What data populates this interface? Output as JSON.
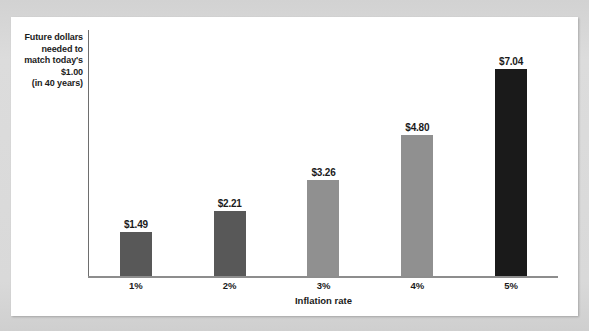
{
  "chart_data": {
    "type": "bar",
    "title": "",
    "xlabel": "Inflation rate",
    "ylabel": "Future dollars needed to match today's $1.00 (in 40 years)",
    "ylabel_lines": [
      "Future dollars",
      "needed to",
      "match today's",
      "$1.00",
      "(in 40 years)"
    ],
    "categories": [
      "1%",
      "2%",
      "3%",
      "4%",
      "5%"
    ],
    "values": [
      1.49,
      2.21,
      3.26,
      4.8,
      7.04
    ],
    "value_labels": [
      "$1.49",
      "$2.21",
      "$3.26",
      "$4.80",
      "$7.04"
    ],
    "bar_colors": [
      "#585858",
      "#585858",
      "#909090",
      "#909090",
      "#1a1a1a"
    ],
    "ylim": [
      0,
      8.35
    ],
    "grid": false,
    "legend": "none",
    "axis_color": "#8d8d8d",
    "value_label_color": "#1b1b1b"
  },
  "canvas": {
    "page_background": "#d9d9d9",
    "card_background": "#ffffff"
  }
}
